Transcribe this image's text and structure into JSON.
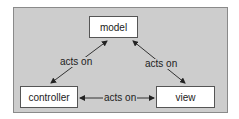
{
  "diagram": {
    "nodes": [
      {
        "id": "model",
        "label": "model"
      },
      {
        "id": "controller",
        "label": "controller"
      },
      {
        "id": "view",
        "label": "view"
      }
    ],
    "edges": [
      {
        "from": "controller",
        "to": "model",
        "label": "acts on",
        "bidirectional": true
      },
      {
        "from": "model",
        "to": "view",
        "label": "acts on",
        "bidirectional": true
      },
      {
        "from": "controller",
        "to": "view",
        "label": "acts on",
        "bidirectional": true
      }
    ],
    "colors": {
      "panel": "#cdcdcd",
      "node_fill": "#ffffff",
      "line": "#333333"
    }
  }
}
